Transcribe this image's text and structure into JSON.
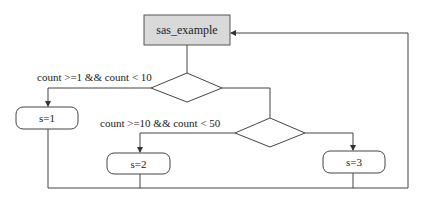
{
  "diagram": {
    "type": "flowchart",
    "start": {
      "label": "sas_example",
      "fill": "#d9d9d9",
      "stroke": "#555555"
    },
    "decisions": [
      {
        "id": "d1",
        "condition": "count >=1 && count < 10"
      },
      {
        "id": "d2",
        "condition": "count >=10 && count < 50"
      }
    ],
    "processes": [
      {
        "id": "p1",
        "label": "s=1"
      },
      {
        "id": "p2",
        "label": "s=2"
      },
      {
        "id": "p3",
        "label": "s=3"
      }
    ],
    "edges": [
      {
        "from": "start",
        "to": "d1"
      },
      {
        "from": "d1",
        "to": "p1",
        "label": "count >=1 && count < 10"
      },
      {
        "from": "d1",
        "to": "d2"
      },
      {
        "from": "d2",
        "to": "p2",
        "label": "count >=10 && count < 50"
      },
      {
        "from": "d2",
        "to": "p3"
      },
      {
        "from": "p1",
        "to": "start"
      },
      {
        "from": "p2",
        "to": "start"
      },
      {
        "from": "p3",
        "to": "start"
      }
    ],
    "line_color": "#444444"
  }
}
